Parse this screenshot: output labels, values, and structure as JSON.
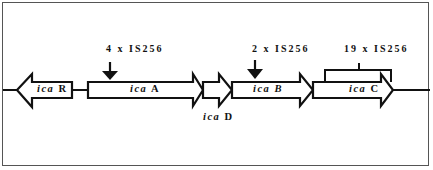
{
  "diagram": {
    "type": "gene-operon-map",
    "genes": [
      {
        "id": "icaR",
        "prefix": "ica",
        "suffix": "R",
        "direction": "left"
      },
      {
        "id": "icaA",
        "prefix": "ica",
        "suffix": "A",
        "direction": "right"
      },
      {
        "id": "icaD",
        "prefix": "ica",
        "suffix": "D",
        "direction": "right"
      },
      {
        "id": "icaB",
        "prefix": "ica",
        "suffix": "B",
        "direction": "right"
      },
      {
        "id": "icaC",
        "prefix": "ica",
        "suffix": "C",
        "direction": "right"
      }
    ],
    "insertions": [
      {
        "label": "4 x IS256",
        "target": "icaA",
        "marker": "arrow"
      },
      {
        "label": "2 x IS256",
        "target": "icaB",
        "marker": "arrow"
      },
      {
        "label": "19 x IS256",
        "target": "icaC",
        "marker": "bracket"
      }
    ],
    "colors": {
      "stroke": "#111111",
      "fill": "#ffffff",
      "frame": "#555555"
    }
  }
}
